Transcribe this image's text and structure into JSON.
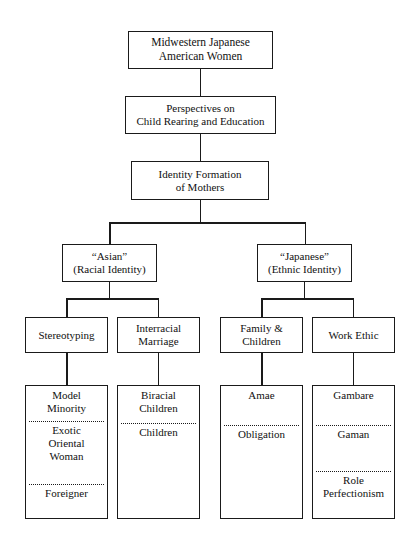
{
  "diagram": {
    "root": {
      "line1": "Midwestern Japanese",
      "line2": "American Women"
    },
    "level2": {
      "line1": "Perspectives on",
      "line2": "Child Rearing and Education"
    },
    "level3": {
      "line1": "Identity Formation",
      "line2": "of Mothers"
    },
    "branches": [
      {
        "line1": "“Asian”",
        "line2": "(Racial Identity)"
      },
      {
        "line1": "“Japanese”",
        "line2": "(Ethnic Identity)"
      }
    ],
    "categories": [
      {
        "line1": "Stereotyping",
        "line2": ""
      },
      {
        "line1": "Interracial",
        "line2": "Marriage"
      },
      {
        "line1": "Family &",
        "line2": "Children"
      },
      {
        "line1": "Work Ethic",
        "line2": ""
      }
    ],
    "leaves": [
      {
        "items": [
          {
            "line1": "Model",
            "line2": "Minority"
          },
          {
            "line1": "Exotic",
            "line2": "Oriental",
            "line3": "Woman"
          },
          {
            "line1": "Foreigner",
            "line2": ""
          }
        ]
      },
      {
        "items": [
          {
            "line1": "Biracial",
            "line2": "Children"
          },
          {
            "line1": "Happa",
            "line2": ""
          }
        ]
      },
      {
        "items": [
          {
            "line1": "Amae",
            "line2": ""
          },
          {
            "line1": "Obligation",
            "line2": ""
          }
        ]
      },
      {
        "items": [
          {
            "line1": "Gambare",
            "line2": ""
          },
          {
            "line1": "Gaman",
            "line2": ""
          },
          {
            "line1": "Role",
            "line2": "Perfectionism"
          }
        ]
      }
    ],
    "colors": {
      "ink": "#1a1a1a",
      "paper": "#ffffff"
    }
  }
}
